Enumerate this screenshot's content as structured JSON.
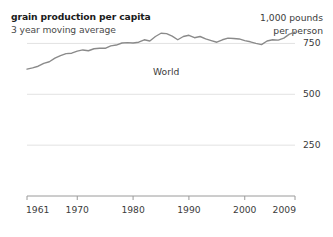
{
  "header": {
    "title": "grain production per capita",
    "subtitle": "3 year moving average",
    "unit_line1": "1,000 pounds",
    "unit_line2": "per person"
  },
  "chart_data": {
    "type": "line",
    "title": "grain production per capita",
    "subtitle": "3 year moving average",
    "xlabel": "",
    "ylabel": "1,000 pounds per person",
    "xlim": [
      1961,
      2009
    ],
    "ylim": [
      0,
      875
    ],
    "grid": true,
    "grid_axis": "y",
    "legend": "inline-label",
    "series_label": "World",
    "yticks": [
      750,
      500,
      250
    ],
    "ytick_labels": [
      "750",
      "500",
      "250"
    ],
    "xticks": [
      1961,
      1970,
      1980,
      1990,
      2000,
      2009
    ],
    "xtick_labels": [
      "1961",
      "1970",
      "1980",
      "1990",
      "2000",
      "2009"
    ],
    "series": [
      {
        "name": "World",
        "x": [
          1961,
          1962,
          1963,
          1964,
          1965,
          1966,
          1967,
          1968,
          1969,
          1970,
          1971,
          1972,
          1973,
          1974,
          1975,
          1976,
          1977,
          1978,
          1979,
          1980,
          1981,
          1982,
          1983,
          1984,
          1985,
          1986,
          1987,
          1988,
          1989,
          1990,
          1991,
          1992,
          1993,
          1994,
          1995,
          1996,
          1997,
          1998,
          1999,
          2000,
          2001,
          2002,
          2003,
          2004,
          2005,
          2006,
          2007,
          2008,
          2009
        ],
        "values": [
          624,
          630,
          638,
          652,
          660,
          678,
          690,
          700,
          702,
          712,
          718,
          714,
          724,
          726,
          726,
          738,
          742,
          752,
          754,
          752,
          756,
          768,
          762,
          784,
          800,
          798,
          786,
          768,
          784,
          790,
          778,
          784,
          772,
          764,
          756,
          768,
          776,
          774,
          772,
          764,
          758,
          750,
          744,
          762,
          768,
          766,
          776,
          796,
          806
        ]
      }
    ]
  }
}
